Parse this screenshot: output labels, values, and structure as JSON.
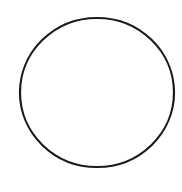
{
  "diagram": {
    "shape": "circle",
    "background_color": "#ffffff",
    "stroke_color": "#1a1a1a",
    "fill_color": "none",
    "stroke_width": 2.2,
    "center": {
      "cx": 97,
      "cy": 92.5
    },
    "radius": {
      "rx": 77,
      "ry": 74.5
    }
  }
}
